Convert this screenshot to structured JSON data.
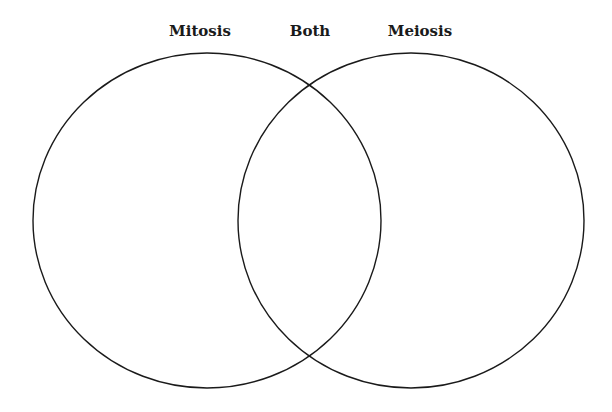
{
  "diagram": {
    "type": "venn",
    "labels": {
      "left": "Mitosis",
      "center": "Both",
      "right": "Meiosis"
    },
    "sets": [
      {
        "name": "Mitosis",
        "contents": []
      },
      {
        "name": "Both",
        "contents": []
      },
      {
        "name": "Meiosis",
        "contents": []
      }
    ],
    "colors": {
      "stroke": "#1a1a1a",
      "background": "#ffffff"
    }
  }
}
